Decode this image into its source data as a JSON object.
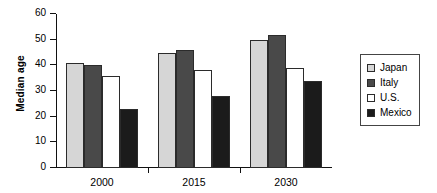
{
  "chart_data": {
    "type": "bar",
    "title": "",
    "xlabel": "",
    "ylabel": "Median age",
    "categories": [
      "2000",
      "2015",
      "2030"
    ],
    "ylim": [
      0,
      60
    ],
    "yticks": [
      0,
      10,
      20,
      30,
      40,
      50,
      60
    ],
    "ytick_labels": [
      "0",
      "10",
      "20",
      "30",
      "40",
      "50",
      "60"
    ],
    "grid": false,
    "legend_position": "right",
    "series": [
      {
        "name": "Japan",
        "color": "#d6d6d6",
        "values": [
          41,
          45,
          50
        ]
      },
      {
        "name": "Italy",
        "color": "#494949",
        "values": [
          40,
          46,
          52
        ]
      },
      {
        "name": "U.S.",
        "color": "#ffffff",
        "values": [
          36,
          38,
          39
        ]
      },
      {
        "name": "Mexico",
        "color": "#1b1b1b",
        "values": [
          23,
          28,
          34
        ]
      }
    ]
  },
  "legend": {
    "items": [
      {
        "label": "Japan"
      },
      {
        "label": "Italy"
      },
      {
        "label": "U.S."
      },
      {
        "label": "Mexico"
      }
    ]
  }
}
